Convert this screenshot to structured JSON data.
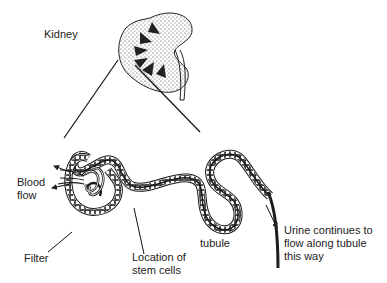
{
  "diagram": {
    "labels": {
      "kidney": "Kidney",
      "blood_flow": "Blood\nflow",
      "filter": "Filter",
      "stem_cells": "Location of\nstem cells",
      "tubule": "tubule",
      "urine": "Urine continues to\nflow along tubule\nthis way"
    },
    "colors": {
      "ink": "#1a1a1a",
      "background": "#ffffff"
    }
  }
}
